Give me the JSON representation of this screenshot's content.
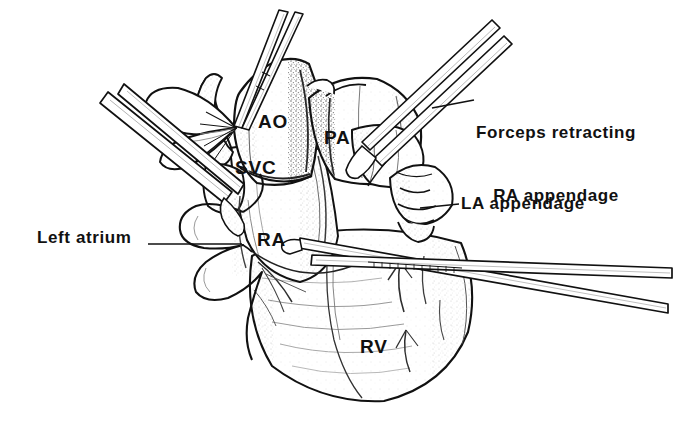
{
  "figure": {
    "background_color": "#ffffff",
    "ink_color": "#111111",
    "style": "pen-and-ink line drawing with stipple shading"
  },
  "structure_labels": [
    {
      "id": "ao",
      "text": "AO",
      "x": 258,
      "y": 110,
      "meaning": "Aorta"
    },
    {
      "id": "pa",
      "text": "PA",
      "x": 324,
      "y": 126,
      "meaning": "Pulmonary artery"
    },
    {
      "id": "svc",
      "text": "SVC",
      "x": 235,
      "y": 156,
      "meaning": "Superior vena cava"
    },
    {
      "id": "ra",
      "text": "RA",
      "x": 257,
      "y": 228,
      "meaning": "Right atrium"
    },
    {
      "id": "rv",
      "text": "RV",
      "x": 360,
      "y": 335,
      "meaning": "Right ventricle"
    }
  ],
  "callouts": [
    {
      "id": "forceps-retracting-ra-appendage",
      "line1": "Forceps retracting",
      "line2": "RA appendage",
      "text_x": 476,
      "text_y": 82,
      "leader": {
        "x1": 432,
        "y1": 108,
        "x2": 474,
        "y2": 100
      }
    },
    {
      "id": "la-appendage",
      "line1": "LA appendage",
      "line2": "",
      "text_x": 461,
      "text_y": 194,
      "leader": {
        "x1": 420,
        "y1": 208,
        "x2": 459,
        "y2": 204
      }
    },
    {
      "id": "left-atrium",
      "line1": "Left atrium",
      "line2": "",
      "text_x": 37,
      "text_y": 228,
      "leader": {
        "x1": 148,
        "y1": 244,
        "x2": 242,
        "y2": 244
      }
    }
  ],
  "instruments": [
    {
      "id": "upper-left-retractor",
      "description": "retractor shaft entering from upper left toward SVC"
    },
    {
      "id": "top-center-forceps",
      "description": "forceps shaft entering from top center toward aorta"
    },
    {
      "id": "upper-right-forceps",
      "description": "forceps retracting the right atrial appendage from upper right"
    },
    {
      "id": "lower-right-clamp",
      "description": "clamp shaft crossing the right ventricle to lower right"
    }
  ]
}
